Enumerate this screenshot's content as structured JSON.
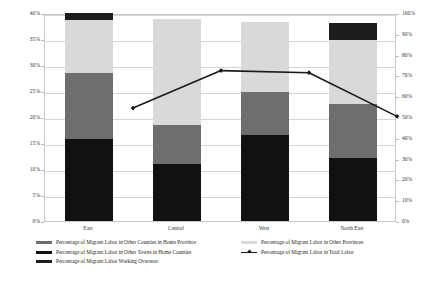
{
  "chart_data": {
    "type": "bar",
    "title": "",
    "xlabel": "",
    "ylabel": "",
    "categories": [
      "East",
      "Central",
      "West",
      "North East"
    ],
    "ylim": [
      0,
      40
    ],
    "ylim_secondary": [
      0,
      100
    ],
    "y_unit": "%",
    "y_ticks_left": [
      "0%",
      "5%",
      "10%",
      "15%",
      "20%",
      "25%",
      "30%",
      "35%",
      "40%"
    ],
    "y_tick_values_left": [
      0,
      5,
      10,
      15,
      20,
      25,
      30,
      35,
      40
    ],
    "y_ticks_right": [
      "0%",
      "10%",
      "20%",
      "30%",
      "40%",
      "50%",
      "60%",
      "70%",
      "80%",
      "90%",
      "100%"
    ],
    "y_tick_values_right": [
      0,
      10,
      20,
      30,
      40,
      50,
      60,
      70,
      80,
      90,
      100
    ],
    "grid": true,
    "legend_position": "bottom",
    "stacked": true,
    "series": [
      {
        "name": "Percentage of Migrant Labor in Other Towns in Home Counties",
        "key": "other_towns_home_counties",
        "color": "#111111",
        "axis": "left",
        "type": "bar",
        "values": [
          15.8,
          10.9,
          16.6,
          12.1
        ]
      },
      {
        "name": "Percentage of Migrant Labor in Other Counties in Home Province",
        "key": "other_counties_home_province",
        "color": "#6e6e6e",
        "axis": "left",
        "type": "bar",
        "values": [
          12.6,
          7.5,
          8.2,
          10.4
        ]
      },
      {
        "name": "Percentage of Migrant Labor in Other Provinces",
        "key": "other_provinces",
        "color": "#d9d9d9",
        "axis": "left",
        "type": "bar",
        "values": [
          10.3,
          20.4,
          13.5,
          12.4
        ]
      },
      {
        "name": "Percentage of Migrant Labor Working Overseas",
        "key": "working_overseas",
        "color": "#1d1d1d",
        "axis": "left",
        "type": "bar",
        "values": [
          1.3,
          0.0,
          0.0,
          3.1
        ]
      },
      {
        "name": "Percentage of Migrant Labor in Total Labor",
        "key": "total_labor",
        "color": "#1a1a1a",
        "axis": "right",
        "type": "line",
        "values": [
          62.0,
          80.0,
          79.0,
          58.0
        ]
      }
    ]
  },
  "legend": {
    "items": [
      {
        "label": "Percentage of Migrant Labor in Other Counties in Home Province",
        "swatch": "bar",
        "color": "#6e6e6e"
      },
      {
        "label": "Percentage of Migrant Labor in Other Provinces",
        "swatch": "bar",
        "color": "#d9d9d9"
      },
      {
        "label": "Percentage of Migrant Labor in Other Towns in Home Counties",
        "swatch": "bar",
        "color": "#111111"
      },
      {
        "label": "Percentage of Migrant Labor in Total Labor",
        "swatch": "line",
        "color": "#1a1a1a"
      },
      {
        "label": "Percentage of Migrant Labor Working Overseas",
        "swatch": "bar",
        "color": "#1d1d1d"
      }
    ]
  },
  "colors": {
    "grid": "#d5d5d5",
    "frame": "#c9c9c9",
    "text": "#231f20",
    "background": "#ffffff"
  }
}
